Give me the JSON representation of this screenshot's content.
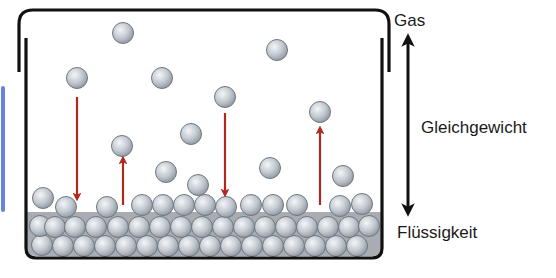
{
  "labels": {
    "gas": "Gas",
    "equilibrium": "Gleichgewicht",
    "liquid": "Flüssigkeit"
  },
  "colors": {
    "container": "#111111",
    "liquid_fill": "#a9acb2",
    "particle_light": "#f4f6f8",
    "particle_mid": "#c3c9d0",
    "particle_dark": "#8e959e",
    "particle_stroke": "#6f7780",
    "transition_arrow": "#b3281e",
    "equilibrium_arrow": "#111111",
    "edge_mark": "#4a6fd8"
  },
  "particle_radius": 10.5,
  "gas_particles": [
    [
      123,
      33
    ],
    [
      277,
      50
    ],
    [
      77,
      78
    ],
    [
      162,
      78
    ],
    [
      225,
      97
    ],
    [
      191,
      134
    ],
    [
      320,
      112
    ],
    [
      122,
      146
    ],
    [
      166,
      172
    ],
    [
      270,
      168
    ],
    [
      198,
      185
    ],
    [
      343,
      176
    ]
  ],
  "liquid_surface_particles": [
    [
      43,
      198
    ],
    [
      66,
      207
    ],
    [
      107,
      207
    ],
    [
      142,
      205
    ],
    [
      163,
      205
    ],
    [
      184,
      205
    ],
    [
      205,
      205
    ],
    [
      226,
      207
    ],
    [
      251,
      205
    ],
    [
      273,
      205
    ],
    [
      297,
      205
    ],
    [
      340,
      206
    ],
    [
      362,
      204
    ]
  ],
  "liquid_middle_row": [
    [
      40,
      226
    ],
    [
      55,
      227
    ],
    [
      75,
      227
    ],
    [
      96,
      227
    ],
    [
      118,
      227
    ],
    [
      139,
      227
    ],
    [
      160,
      227
    ],
    [
      181,
      227
    ],
    [
      202,
      227
    ],
    [
      223,
      227
    ],
    [
      244,
      227
    ],
    [
      265,
      227
    ],
    [
      286,
      227
    ],
    [
      307,
      227
    ],
    [
      328,
      227
    ],
    [
      349,
      227
    ],
    [
      369,
      226
    ]
  ],
  "liquid_bottom_row": [
    [
      42,
      245
    ],
    [
      63,
      246
    ],
    [
      84,
      246
    ],
    [
      105,
      246
    ],
    [
      126,
      246
    ],
    [
      147,
      246
    ],
    [
      168,
      246
    ],
    [
      189,
      246
    ],
    [
      210,
      246
    ],
    [
      231,
      246
    ],
    [
      252,
      246
    ],
    [
      273,
      246
    ],
    [
      294,
      246
    ],
    [
      315,
      246
    ],
    [
      336,
      246
    ],
    [
      357,
      246
    ]
  ],
  "transition_arrows": [
    {
      "direction": "down",
      "x": 77,
      "y1": 97,
      "y2": 197
    },
    {
      "direction": "up",
      "x": 123,
      "y1": 205,
      "y2": 160
    },
    {
      "direction": "down",
      "x": 225,
      "y1": 113,
      "y2": 193
    },
    {
      "direction": "up",
      "x": 320,
      "y1": 205,
      "y2": 130
    }
  ],
  "equilibrium_arrow": {
    "x": 408,
    "y_top": 38,
    "y_bottom": 212
  }
}
